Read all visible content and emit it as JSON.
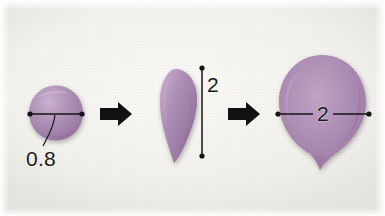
{
  "figure": {
    "background_color": "#f4f3ef",
    "clay_color": "#a887b0",
    "clay_shadow_color": "#8e6a96",
    "clay_highlight_color": "#c4a9ca",
    "annotation_color": "#1a1a1a"
  },
  "steps": [
    {
      "index": 1,
      "name": "ball",
      "shape": "sphere",
      "dimension": {
        "label": "0.8",
        "orientation": "horizontal",
        "kind": "diameter"
      }
    },
    {
      "index": 2,
      "name": "teardrop",
      "shape": "cone-teardrop",
      "dimension": {
        "label": "2",
        "orientation": "vertical",
        "kind": "length"
      }
    },
    {
      "index": 3,
      "name": "petal",
      "shape": "flattened-petal",
      "dimension": {
        "label": "2",
        "orientation": "horizontal",
        "kind": "width"
      }
    }
  ],
  "arrows": [
    {
      "index": 1,
      "direction": "right",
      "between": "ball-to-teardrop"
    },
    {
      "index": 2,
      "direction": "right",
      "between": "teardrop-to-petal"
    }
  ],
  "labels": {
    "ball_diameter": "0.8",
    "teardrop_length": "2",
    "petal_width": "2"
  }
}
